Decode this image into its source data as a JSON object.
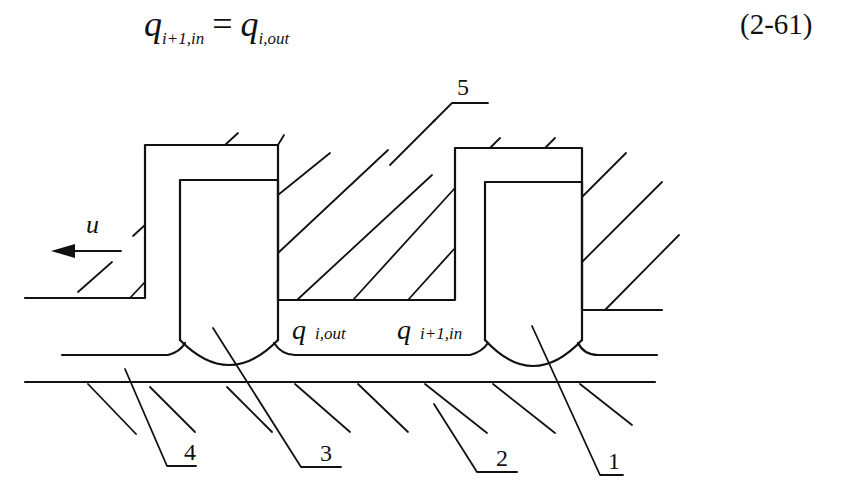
{
  "equation": {
    "lhs_symbol": "q",
    "lhs_subscript": "i+1,in",
    "operator": "=",
    "rhs_symbol": "q",
    "rhs_subscript": "i,out",
    "number": "(2-61)"
  },
  "figure": {
    "velocity_label": "u",
    "velocity_direction": "left",
    "flow_labels": {
      "outlet": {
        "symbol": "q",
        "subscript": "i,out"
      },
      "inlet": {
        "symbol": "q",
        "subscript": "i+1,in"
      }
    },
    "callouts": [
      {
        "id": "1",
        "label": "1"
      },
      {
        "id": "2",
        "label": "2"
      },
      {
        "id": "3",
        "label": "3"
      },
      {
        "id": "4",
        "label": "4"
      },
      {
        "id": "5",
        "label": "5"
      }
    ],
    "colors": {
      "line": "#111111",
      "background": "#ffffff"
    }
  }
}
